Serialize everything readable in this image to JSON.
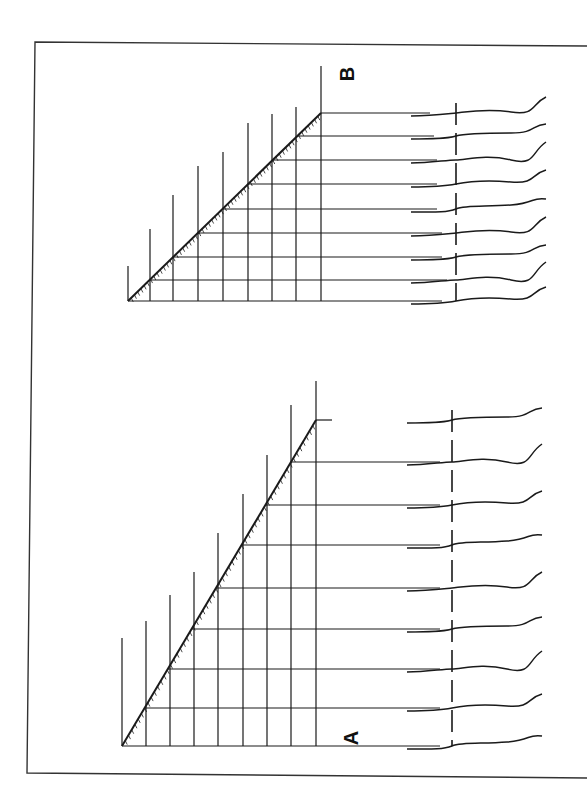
{
  "figure": {
    "panels": [
      {
        "label": "B",
        "label_pos": [
          347,
          74
        ],
        "grid": {
          "base_y": 301,
          "verticals_x": [
            128,
            150,
            173,
            198,
            223,
            248,
            272,
            296,
            321
          ],
          "vertical_tops": [
            266,
            229,
            195,
            166,
            152,
            123,
            114,
            107,
            66
          ],
          "horizontals_y": [
            301,
            280,
            257,
            233,
            209,
            184,
            160,
            136,
            113
          ],
          "apex": [
            321,
            113
          ],
          "origin": [
            128,
            301
          ]
        },
        "traces_axis_x": 456,
        "traces": [
          {
            "y": 113,
            "leader_end": 442
          },
          {
            "y": 136,
            "leader_end": 447
          },
          {
            "y": 160,
            "leader_end": 442
          },
          {
            "y": 184,
            "leader_end": 442
          },
          {
            "y": 209,
            "leader_end": 437
          },
          {
            "y": 233,
            "leader_end": 437
          },
          {
            "y": 257,
            "leader_end": 437
          },
          {
            "y": 280,
            "leader_end": 434
          },
          {
            "y": 301,
            "leader_end": 430
          }
        ]
      },
      {
        "label": "A",
        "label_pos": [
          352,
          738
        ],
        "grid": {
          "base_y": 746,
          "verticals_x": [
            122,
            146,
            170,
            194,
            218,
            243,
            267,
            291,
            316
          ],
          "vertical_tops": [
            638,
            621,
            595,
            572,
            533,
            494,
            455,
            405,
            381
          ],
          "horizontals_y": [
            746,
            708,
            669,
            629,
            588,
            545,
            505,
            462,
            420
          ],
          "apex": [
            316,
            420
          ],
          "origin": [
            122,
            746
          ]
        },
        "traces_axis_x": 452,
        "traces": [
          {
            "y": 420,
            "leader_end": 440
          },
          {
            "y": 462,
            "leader_end": 440
          },
          {
            "y": 505,
            "leader_end": 440
          },
          {
            "y": 545,
            "leader_end": 440
          },
          {
            "y": 588,
            "leader_end": 440
          },
          {
            "y": 629,
            "leader_end": 440
          },
          {
            "y": 669,
            "leader_end": 440
          },
          {
            "y": 708,
            "leader_end": 440
          },
          {
            "y": 746,
            "leader_end": 332
          }
        ]
      }
    ],
    "frame": {
      "top_left": [
        35,
        42
      ],
      "bottom_left": [
        27,
        773
      ]
    },
    "colors": {
      "ink": "#1a1a1a",
      "paper": "#ffffff"
    }
  }
}
